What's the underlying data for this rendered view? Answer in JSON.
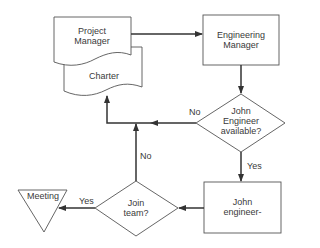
{
  "diagram": {
    "type": "flowchart",
    "nodes": {
      "project_manager": {
        "shape": "document",
        "line1": "Project",
        "line2": "Manager"
      },
      "charter": {
        "shape": "document",
        "label": "Charter"
      },
      "engineering_manager": {
        "shape": "process",
        "line1": "Engineering",
        "line2": "Manager"
      },
      "engineer_available": {
        "shape": "decision",
        "line1": "John",
        "line2": "Engineer",
        "line3": "available?"
      },
      "john_engineer": {
        "shape": "process",
        "line1": "John",
        "line2": "engineer-"
      },
      "join_team": {
        "shape": "decision",
        "line1": "Join",
        "line2": "team?"
      },
      "meeting": {
        "shape": "merge-triangle",
        "label": "Meeting"
      }
    },
    "edges": [
      {
        "from": "project_manager",
        "to": "engineering_manager",
        "label": ""
      },
      {
        "from": "engineering_manager",
        "to": "engineer_available",
        "label": ""
      },
      {
        "from": "engineer_available",
        "to": "charter",
        "label": "No"
      },
      {
        "from": "engineer_available",
        "to": "john_engineer",
        "label": "Yes"
      },
      {
        "from": "john_engineer",
        "to": "join_team",
        "label": ""
      },
      {
        "from": "join_team",
        "to": "charter",
        "label": "No"
      },
      {
        "from": "join_team",
        "to": "meeting",
        "label": "Yes"
      }
    ],
    "edge_labels": {
      "available_no": "No",
      "available_yes": "Yes",
      "join_no": "No",
      "join_yes": "Yes"
    },
    "colors": {
      "line": "#4a4a4a",
      "text": "#3a3a3a",
      "background": "#ffffff"
    }
  }
}
